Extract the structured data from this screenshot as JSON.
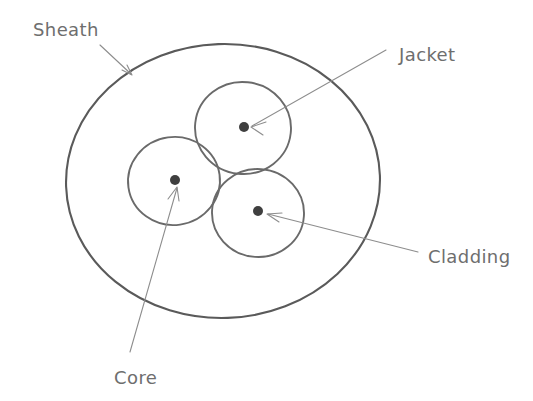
{
  "diagram": {
    "canvas": {
      "width": 533,
      "height": 401,
      "background": "#ffffff"
    },
    "colors": {
      "sheath_stroke": "#5a5a5a",
      "circle_stroke": "#6a6a6a",
      "dot_fill": "#3f3f3f",
      "leader_stroke": "#8d8d8d",
      "label_text": "#6e6e6e"
    },
    "sheath": {
      "name": "sheath-ellipse",
      "cx": 223,
      "cy": 181,
      "rx": 157,
      "ry": 137
    },
    "strands": [
      {
        "name": "jacket-circle",
        "cx": 243,
        "cy": 128,
        "r": 47,
        "dot_r": 5
      },
      {
        "name": "core-circle",
        "cx": 174,
        "cy": 181,
        "r": 45,
        "dot_r": 5
      },
      {
        "name": "cladding-circle",
        "cx": 258,
        "cy": 213,
        "r": 45,
        "dot_r": 5
      }
    ],
    "labels": [
      {
        "id": "sheath",
        "text": "Sheath",
        "x": 33,
        "y": 36,
        "leader": {
          "x1": 100,
          "y1": 45,
          "x2": 131,
          "y2": 74
        }
      },
      {
        "id": "jacket",
        "text": "Jacket",
        "x": 399,
        "y": 61,
        "leader": {
          "x1": 386,
          "y1": 50,
          "x2": 252,
          "y2": 126
        }
      },
      {
        "id": "cladding",
        "text": "Cladding",
        "x": 428,
        "y": 263,
        "leader": {
          "x1": 418,
          "y1": 252,
          "x2": 268,
          "y2": 214
        }
      },
      {
        "id": "core",
        "text": "Core",
        "x": 114,
        "y": 384,
        "leader": {
          "x1": 130,
          "y1": 352,
          "x2": 177,
          "y2": 188
        }
      }
    ]
  }
}
